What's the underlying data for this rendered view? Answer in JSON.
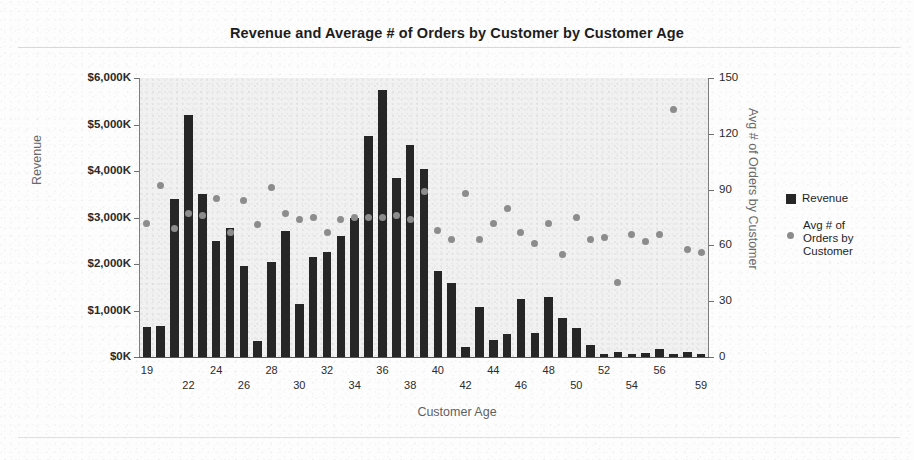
{
  "chart_data": {
    "type": "bar",
    "title": "Revenue and Average # of Orders by Customer by Customer Age",
    "xlabel": "Customer Age",
    "ylabel": "Revenue",
    "y2label": "Avg # of Orders by Customer",
    "grid": false,
    "legend_position": "right",
    "ylim": [
      0,
      6000
    ],
    "y2lim": [
      0,
      150
    ],
    "ytick_labels": [
      "$6,000K",
      "$5,000K",
      "$4,000K",
      "$3,000K",
      "$2,000K",
      "$1,000K",
      "$0K"
    ],
    "ytick_values": [
      6000,
      5000,
      4000,
      3000,
      2000,
      1000,
      0
    ],
    "y2tick_labels": [
      "150",
      "120",
      "90",
      "60",
      "30",
      "0"
    ],
    "y2tick_values": [
      150,
      120,
      90,
      60,
      30,
      0
    ],
    "categories": [
      19,
      20,
      21,
      22,
      23,
      24,
      25,
      26,
      27,
      28,
      29,
      30,
      31,
      32,
      33,
      34,
      35,
      36,
      37,
      38,
      39,
      40,
      41,
      42,
      43,
      44,
      45,
      46,
      47,
      48,
      49,
      50,
      51,
      52,
      53,
      54,
      55,
      56,
      57,
      58,
      59
    ],
    "xtick_labels": [
      "19",
      "22",
      "24",
      "26",
      "28",
      "30",
      "32",
      "34",
      "36",
      "38",
      "40",
      "42",
      "44",
      "46",
      "48",
      "50",
      "52",
      "54",
      "56",
      "59"
    ],
    "xtick_values": [
      19,
      22,
      24,
      26,
      28,
      30,
      32,
      34,
      36,
      38,
      40,
      42,
      44,
      46,
      48,
      50,
      52,
      54,
      56,
      59
    ],
    "series": [
      {
        "name": "Revenue",
        "type": "bar",
        "axis": "left",
        "color": "#262626",
        "units": "$K",
        "values": [
          650,
          660,
          3400,
          5200,
          3500,
          2500,
          2780,
          1950,
          340,
          2050,
          2700,
          1150,
          2150,
          2250,
          2600,
          3000,
          4750,
          5750,
          3850,
          4550,
          4050,
          1840,
          1600,
          220,
          1080,
          370,
          500,
          1250,
          520,
          1280,
          840,
          620,
          260,
          60,
          110,
          60,
          80,
          170,
          60,
          110,
          60
        ]
      },
      {
        "name": "Avg # of Orders by Customer",
        "type": "scatter",
        "axis": "right",
        "color": "#8c8c8c",
        "values": [
          72,
          92,
          69,
          77,
          76,
          85,
          67,
          84,
          71,
          91,
          77,
          74,
          75,
          67,
          74,
          75,
          75,
          75,
          76,
          74,
          89,
          68,
          63,
          88,
          63,
          72,
          80,
          67,
          61,
          72,
          55,
          75,
          63,
          64,
          40,
          66,
          62,
          66,
          133,
          58,
          56
        ]
      }
    ]
  },
  "legend": {
    "items": [
      {
        "label": "Revenue",
        "marker": "square",
        "color": "#262626"
      },
      {
        "label": "Avg # of\nOrders by\nCustomer",
        "marker": "dot",
        "color": "#8c8c8c"
      }
    ],
    "item_0_label": "Revenue",
    "item_1_line_0": "Avg # of",
    "item_1_line_1": "Orders by",
    "item_1_line_2": "Customer"
  }
}
